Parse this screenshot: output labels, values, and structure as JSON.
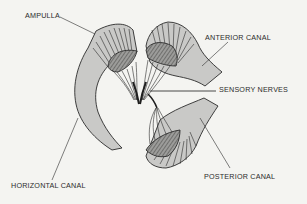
{
  "diagram": {
    "colors": {
      "background": "#f4f4f1",
      "canal_fill": "#c9c9c7",
      "outline": "#2b2b2b",
      "label_text": "#2b2b2b"
    },
    "labels": {
      "ampulla": "AMPULLA",
      "anterior_canal": "ANTERIOR CANAL",
      "sensory_nerves": "SENSORY NERVES",
      "horizontal_canal": "HORIZONTAL CANAL",
      "posterior_canal": "POSTERIOR CANAL"
    },
    "structures": [
      {
        "name": "horizontal-canal",
        "has_ampulla": true
      },
      {
        "name": "anterior-canal",
        "has_ampulla": true
      },
      {
        "name": "posterior-canal",
        "has_ampulla": true
      },
      {
        "name": "sensory-nerves",
        "converge_to": "center"
      }
    ]
  }
}
